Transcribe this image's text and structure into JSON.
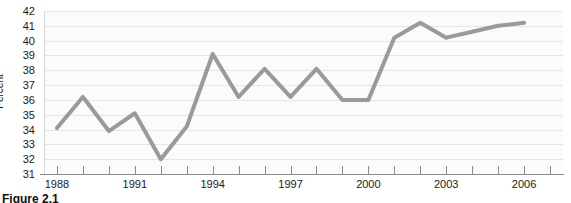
{
  "figure": {
    "caption": "Figure 2.1"
  },
  "chart_data": {
    "type": "line",
    "title": "",
    "xlabel": "",
    "ylabel": "Percent",
    "grid": true,
    "legend": "none",
    "xlim": [
      1987.5,
      2007.5
    ],
    "ylim": [
      31,
      42
    ],
    "y_ticks": [
      31,
      32,
      33,
      34,
      35,
      36,
      37,
      38,
      39,
      40,
      41,
      42
    ],
    "y_tick_labels": [
      "31",
      "32",
      "33",
      "34",
      "35",
      "36",
      "37",
      "38",
      "39",
      "40",
      "41",
      "42"
    ],
    "x_ticks": [
      1988,
      1989,
      1990,
      1991,
      1992,
      1993,
      1994,
      1995,
      1996,
      1997,
      1998,
      1999,
      2000,
      2001,
      2002,
      2003,
      2004,
      2005,
      2006,
      2007
    ],
    "x_tick_labels_shown": [
      "1988",
      "1991",
      "1994",
      "1997",
      "2000",
      "2003",
      "2006"
    ],
    "line_color": "#9a9a9a",
    "line_width": 4,
    "x": [
      1988,
      1989,
      1990,
      1991,
      1992,
      1993,
      1994,
      1995,
      1996,
      1997,
      1998,
      1999,
      2000,
      2001,
      2002,
      2003,
      2004,
      2005,
      2006
    ],
    "values": [
      34.1,
      36.2,
      33.9,
      35.1,
      32.0,
      34.2,
      39.1,
      36.2,
      38.1,
      36.2,
      38.1,
      36.0,
      36.0,
      40.2,
      41.2,
      40.2,
      40.6,
      41.0,
      41.2
    ],
    "series": [
      {
        "name": "Percent",
        "values": [
          34.1,
          36.2,
          33.9,
          35.1,
          32.0,
          34.2,
          39.1,
          36.2,
          38.1,
          36.2,
          38.1,
          36.0,
          36.0,
          40.2,
          41.2,
          40.2,
          40.6,
          41.0,
          41.2
        ]
      }
    ]
  },
  "colors": {
    "line": "#9a9a9a",
    "grid": "#e6e6e6",
    "axis": "#8c8c8c",
    "plot_background": "#fbfbfb",
    "text": "#1a1a1a"
  }
}
